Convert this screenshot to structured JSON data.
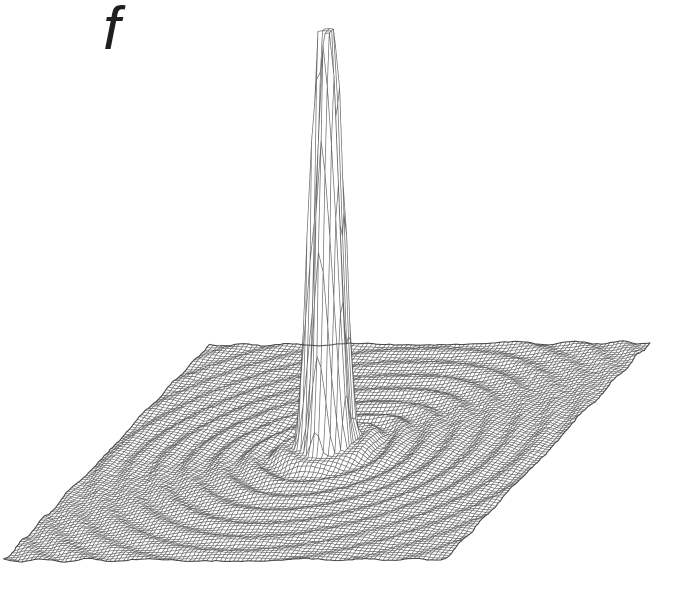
{
  "figure": {
    "label": "f"
  },
  "chart_data": {
    "type": "surface",
    "title": "f",
    "xlabel": "",
    "ylabel": "",
    "zlabel": "",
    "legend": "none",
    "axes_visible": false,
    "grid": {
      "n": 100,
      "x_range": [
        -8,
        8
      ],
      "y_range": [
        -8,
        8
      ],
      "z_range": [
        0,
        1
      ]
    },
    "peak": {
      "x": 0,
      "y": 0,
      "z": 1.0
    },
    "radial_profile": {
      "r": [
        0,
        0.25,
        0.5,
        0.75,
        1.0,
        1.43,
        2.0,
        2.5,
        3.0,
        3.5,
        4.0,
        4.5,
        5.0,
        5.5,
        6.0,
        6.5,
        7.0,
        7.5,
        8.0
      ],
      "z": [
        1.0,
        0.99,
        0.64,
        0.25,
        0.026,
        0.026,
        0.002,
        0.012,
        0.0,
        0.01,
        0.0,
        0.009,
        0.0,
        0.008,
        0.0,
        0.0074,
        0.0,
        0.0069,
        0.0
      ]
    },
    "model": {
      "clip": 1.0,
      "core_amp": 1.08,
      "core_exp": 1.35,
      "mound_amp": 0.06,
      "mound_width": 1.1,
      "ripple_amp": 0.016,
      "ripple_ref": 1.4,
      "ripple_falloff": 0.5,
      "ripple_unevenness": [
        0.3,
        2,
        0.6
      ],
      "warp": [
        0.06,
        3,
        1.7,
        0.05,
        5,
        0.4
      ],
      "seed": 7,
      "jitter_px": 0.5
    },
    "projection": {
      "origin": [
        4,
        562
      ],
      "u_vector": [
        441,
        -2
      ],
      "v_vector": [
        205,
        -216
      ],
      "z_height_px": 422
    },
    "style": {
      "background": "#ffffff",
      "fill": "#ffffff",
      "stroke": "#464646",
      "stroke_alpha": 0.65,
      "line_width": 0.7,
      "edge_stroke": "#3c3c3c",
      "edge_alpha": 0.85,
      "edge_width": 1.1,
      "label_color": "#1f1f1f"
    }
  }
}
